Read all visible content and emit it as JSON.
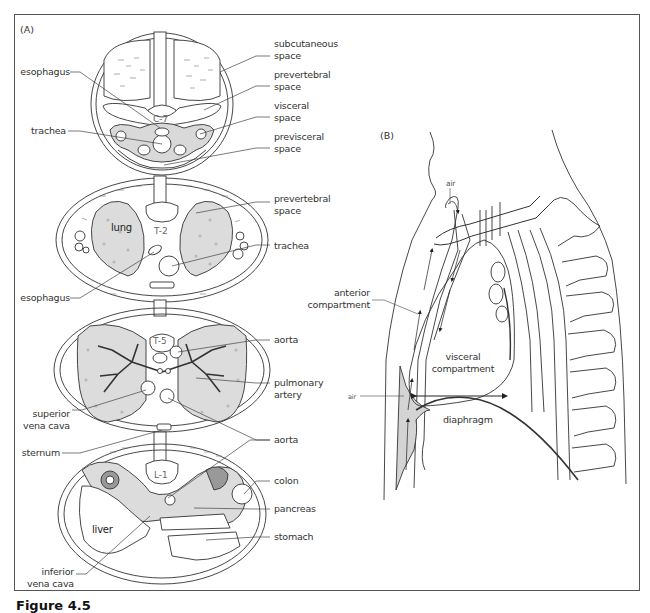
{
  "figure": {
    "caption": "Figure 4.5",
    "panel_a_label": "(A)",
    "panel_b_label": "(B)"
  },
  "panel_a": {
    "section_c7": {
      "vertebra": "C-7",
      "labels_left": [
        "esophagus",
        "trachea"
      ],
      "labels_right": [
        {
          "line1": "subcutaneous",
          "line2": "space"
        },
        {
          "line1": "prevertebral",
          "line2": "space"
        },
        {
          "line1": "visceral",
          "line2": "space"
        },
        {
          "line1": "previsceral",
          "line2": "space"
        }
      ]
    },
    "section_t2": {
      "vertebra": "T-2",
      "organ_label": "lung",
      "labels_left": [
        "esophagus"
      ],
      "labels_right": [
        {
          "line1": "prevertebral",
          "line2": "space"
        },
        {
          "line1": "trachea",
          "line2": ""
        }
      ]
    },
    "section_t5": {
      "vertebra": "T-5",
      "labels_left": [
        {
          "line1": "superior",
          "line2": "vena cava"
        }
      ],
      "labels_right": [
        {
          "line1": "aorta",
          "line2": ""
        },
        {
          "line1": "pulmonary",
          "line2": "artery"
        },
        {
          "line1": "aorta",
          "line2": ""
        }
      ]
    },
    "section_l1": {
      "vertebra": "L-1",
      "organ_label": "liver",
      "labels_left": [
        "sternum",
        {
          "line1": "inferior",
          "line2": "vena cava"
        }
      ],
      "labels_right": [
        "colon",
        "pancreas",
        "stomach"
      ]
    }
  },
  "panel_b": {
    "labels": {
      "air_top": "air",
      "air_side": "air",
      "anterior_line1": "anterior",
      "anterior_line2": "compartment",
      "visceral_line1": "visceral",
      "visceral_line2": "compartment",
      "diaphragm": "diaphragm"
    }
  },
  "colors": {
    "line": "#333333",
    "shade": "#d9d9d9",
    "dot": "#b8b8b8",
    "frame": "#555555"
  }
}
